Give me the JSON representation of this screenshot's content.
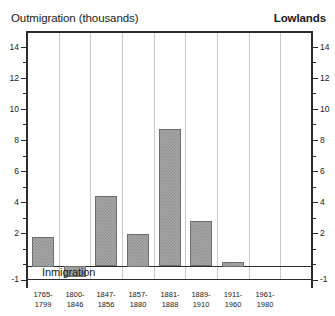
{
  "header": {
    "title": "Outmigration (thousands)",
    "region": "Lowlands"
  },
  "annotations": {
    "inmigration": "Inmigration"
  },
  "axis": {
    "y_major_labels": [
      "14",
      "12",
      "10",
      "8",
      "6",
      "4",
      "2"
    ],
    "y_bottom_label": "-1",
    "y_min": -1,
    "y_max": 15
  },
  "chart_data": {
    "type": "bar",
    "title": "Outmigration (thousands)",
    "subtitle": "Lowlands",
    "xlabel": "",
    "ylabel": "Outmigration (thousands)",
    "ylim": [
      -1,
      15
    ],
    "grid": true,
    "legend": false,
    "annotations": [
      "Inmigration"
    ],
    "categories": [
      "1765-1799",
      "1800-1846",
      "1847-1856",
      "1857-1880",
      "1881-1888",
      "1889-1910",
      "1911-1960",
      "1961-1980"
    ],
    "category_lines": [
      [
        "1765-",
        "1799"
      ],
      [
        "1800-",
        "1846"
      ],
      [
        "1847-",
        "1856"
      ],
      [
        "1857-",
        "1880"
      ],
      [
        "1881-",
        "1888"
      ],
      [
        "1889-",
        "1910"
      ],
      [
        "1911-",
        "1960"
      ],
      [
        "1961-",
        "1980"
      ]
    ],
    "values": [
      1.9,
      -0.7,
      4.5,
      2.1,
      8.8,
      2.9,
      0.3,
      0
    ],
    "y_ticks": [
      -1,
      0,
      2,
      4,
      6,
      8,
      10,
      12,
      14
    ],
    "y_tick_labels": [
      "-1",
      "",
      "2",
      "4",
      "6",
      "8",
      "10",
      "12",
      "14"
    ]
  },
  "colors": {
    "bar_fill": "#a8a8a8",
    "bar_hatch": "#8e8e8e",
    "bar_edge": "#6e6e6e",
    "axis": "#2b2b2b",
    "gridline": "#c9c9c9",
    "text": "#1a1a1a",
    "background": "#ffffff"
  }
}
